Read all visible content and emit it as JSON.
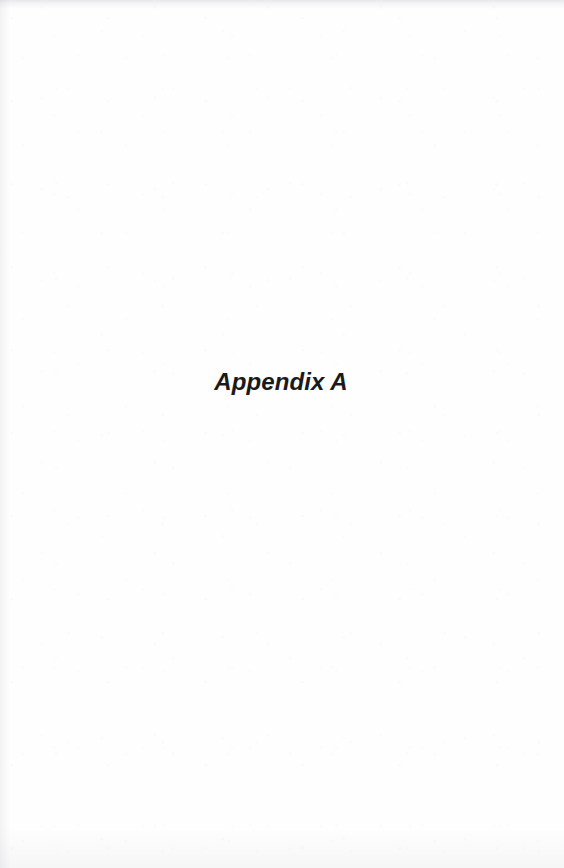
{
  "page": {
    "kind": "scanned-book-divider-page",
    "width": 564,
    "height": 868,
    "background_color": "#fefefe",
    "text_color": "#1a1a1a"
  },
  "content": {
    "appendix_title": "Appendix A"
  }
}
